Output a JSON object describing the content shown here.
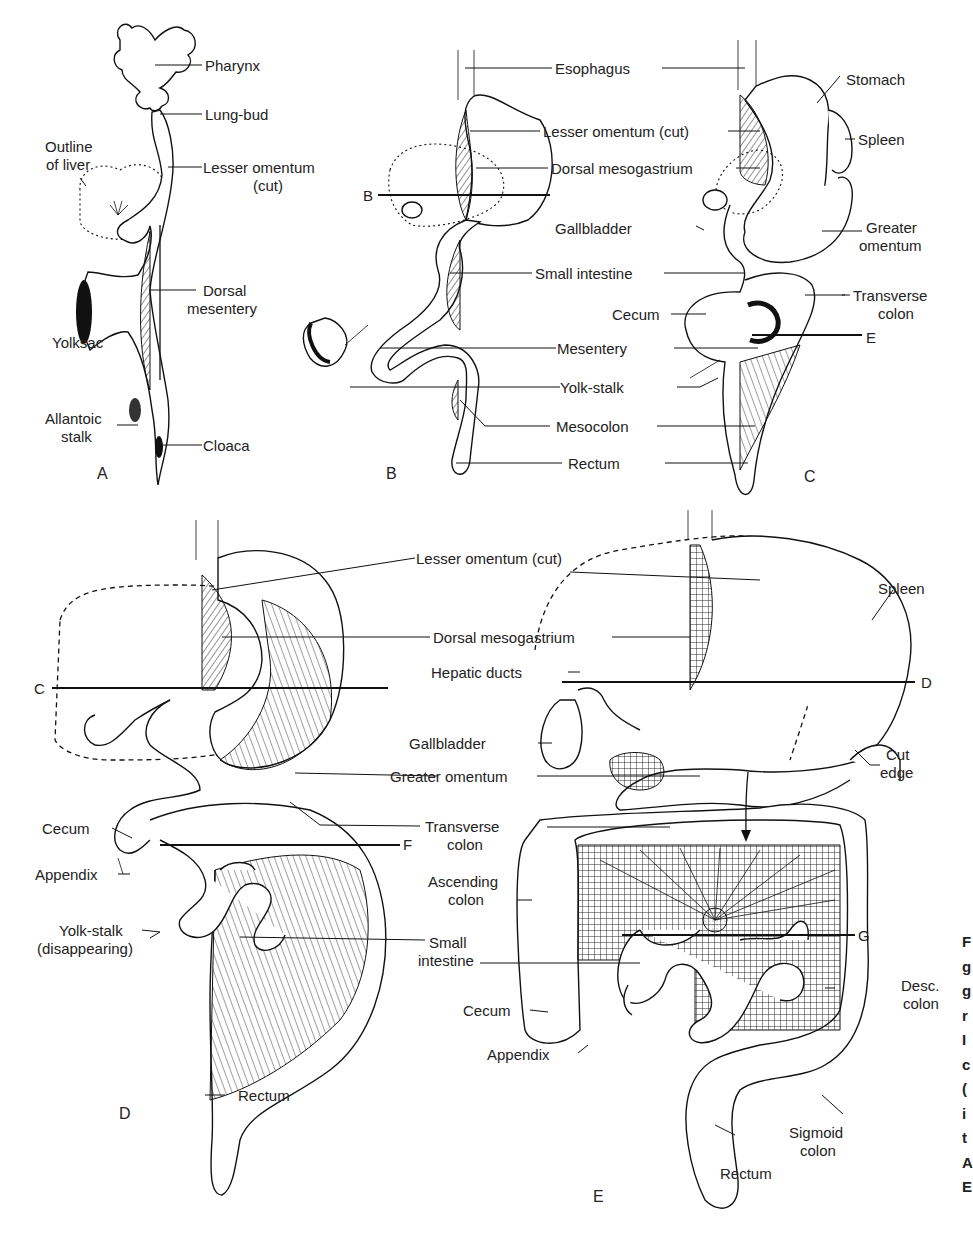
{
  "figure": {
    "panels": {
      "A": {
        "letter": "A",
        "labels": {
          "pharynx": "Pharynx",
          "lung_bud": "Lung-bud",
          "outline_liver_1": "Outline",
          "outline_liver_2": "of liver",
          "lesser_omentum_1": "Lesser omentum",
          "lesser_omentum_2": "(cut)",
          "dorsal_mesentery_1": "Dorsal",
          "dorsal_mesentery_2": "mesentery",
          "yolksac": "Yolksac",
          "allantoic_1": "Allantoic",
          "allantoic_2": "stalk",
          "cloaca": "Cloaca"
        }
      },
      "B": {
        "letter": "B",
        "section_line": "B",
        "labels": {
          "esophagus": "Esophagus",
          "lesser_omentum": "Lesser omentum (cut)",
          "dorsal_mesogastrium": "Dorsal mesogastrium",
          "gallbladder": "Gallbladder",
          "small_intestine": "Small intestine",
          "mesentery": "Mesentery",
          "yolk_stalk": "Yolk-stalk",
          "mesocolon": "Mesocolon",
          "rectum": "Rectum"
        }
      },
      "C": {
        "letter": "C",
        "section_line": "E",
        "labels": {
          "stomach": "Stomach",
          "spleen": "Spleen",
          "greater_omentum_1": "Greater",
          "greater_omentum_2": "omentum",
          "transverse_colon_1": "Transverse",
          "transverse_colon_2": "colon",
          "cecum": "Cecum"
        }
      },
      "D": {
        "letter": "D",
        "section_lines": [
          "C",
          "F"
        ],
        "labels": {
          "lesser_omentum": "Lesser omentum (cut)",
          "dorsal_mesogastrium": "Dorsal mesogastrium",
          "greater_omentum": "Greater omentum",
          "transverse_colon_1": "Transverse",
          "transverse_colon_2": "colon",
          "cecum": "Cecum",
          "appendix": "Appendix",
          "yolk_stalk_1": "Yolk-stalk",
          "yolk_stalk_2": "(disappearing)",
          "small_intestine_1": "Small",
          "small_intestine_2": "intestine",
          "rectum": "Rectum"
        }
      },
      "E": {
        "letter": "E",
        "section_lines": [
          "D",
          "G"
        ],
        "labels": {
          "spleen": "Spleen",
          "hepatic_ducts": "Hepatic ducts",
          "gallbladder": "Gallbladder",
          "cut_edge_1": "Cut",
          "cut_edge_2": "edge",
          "ascending_colon_1": "Ascending",
          "ascending_colon_2": "colon",
          "cecum": "Cecum",
          "appendix": "Appendix",
          "desc_colon_1": "Desc.",
          "desc_colon_2": "colon",
          "sigmoid_colon_1": "Sigmoid",
          "sigmoid_colon_2": "colon",
          "rectum": "Rectum"
        }
      }
    },
    "caption_fragment": [
      "F",
      "g",
      "g",
      "r",
      "I",
      "c",
      "(",
      "i",
      "t",
      "A",
      "E"
    ]
  }
}
